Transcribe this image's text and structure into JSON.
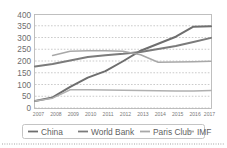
{
  "chart_data": {
    "type": "line",
    "title": "",
    "subtitle": "",
    "xlabel": "",
    "ylabel": "",
    "categories": [
      "2007",
      "2008",
      "2009",
      "2010",
      "2011",
      "2012",
      "2013",
      "2014",
      "2015",
      "2016",
      "2017"
    ],
    "ylim": [
      0,
      400
    ],
    "ytick_labels": [
      "0",
      "50",
      "100",
      "150",
      "200",
      "250",
      "300",
      "350",
      "400"
    ],
    "ytick_values": [
      0,
      50,
      100,
      150,
      200,
      250,
      300,
      350,
      400
    ],
    "grid": true,
    "grid_style": "dotted-horizontal",
    "legend_position": "bottom",
    "series": [
      {
        "name": "China",
        "color": "#6e6e6e",
        "values": [
          30,
          45,
          90,
          130,
          158,
          200,
          245,
          275,
          305,
          348,
          350
        ]
      },
      {
        "name": "World Bank",
        "color": "#7b7b7b",
        "values": [
          178,
          188,
          203,
          218,
          226,
          232,
          240,
          252,
          265,
          282,
          300
        ]
      },
      {
        "name": "Paris Club",
        "color": "#a8a8a8",
        "values": [
          null,
          225,
          243,
          245,
          245,
          243,
          228,
          196,
          197,
          198,
          200
        ]
      },
      {
        "name": "IMF",
        "color": "#b0b0b0",
        "values": [
          30,
          42,
          78,
          78,
          77,
          76,
          75,
          74,
          73,
          73,
          75
        ]
      }
    ]
  },
  "legend": {
    "items": [
      {
        "label": "China",
        "color": "#6e6e6e"
      },
      {
        "label": "World Bank",
        "color": "#7b7b7b"
      },
      {
        "label": "Paris Club",
        "color": "#a8a8a8"
      },
      {
        "label": "IMF",
        "color": "#b0b0b0"
      }
    ]
  },
  "colors": {
    "frame": "#b9b9b9",
    "grid": "#b4b4b4",
    "tick_text": "#6d6d6d",
    "legend_text": "#5f5f5f",
    "background": "#ffffff"
  }
}
